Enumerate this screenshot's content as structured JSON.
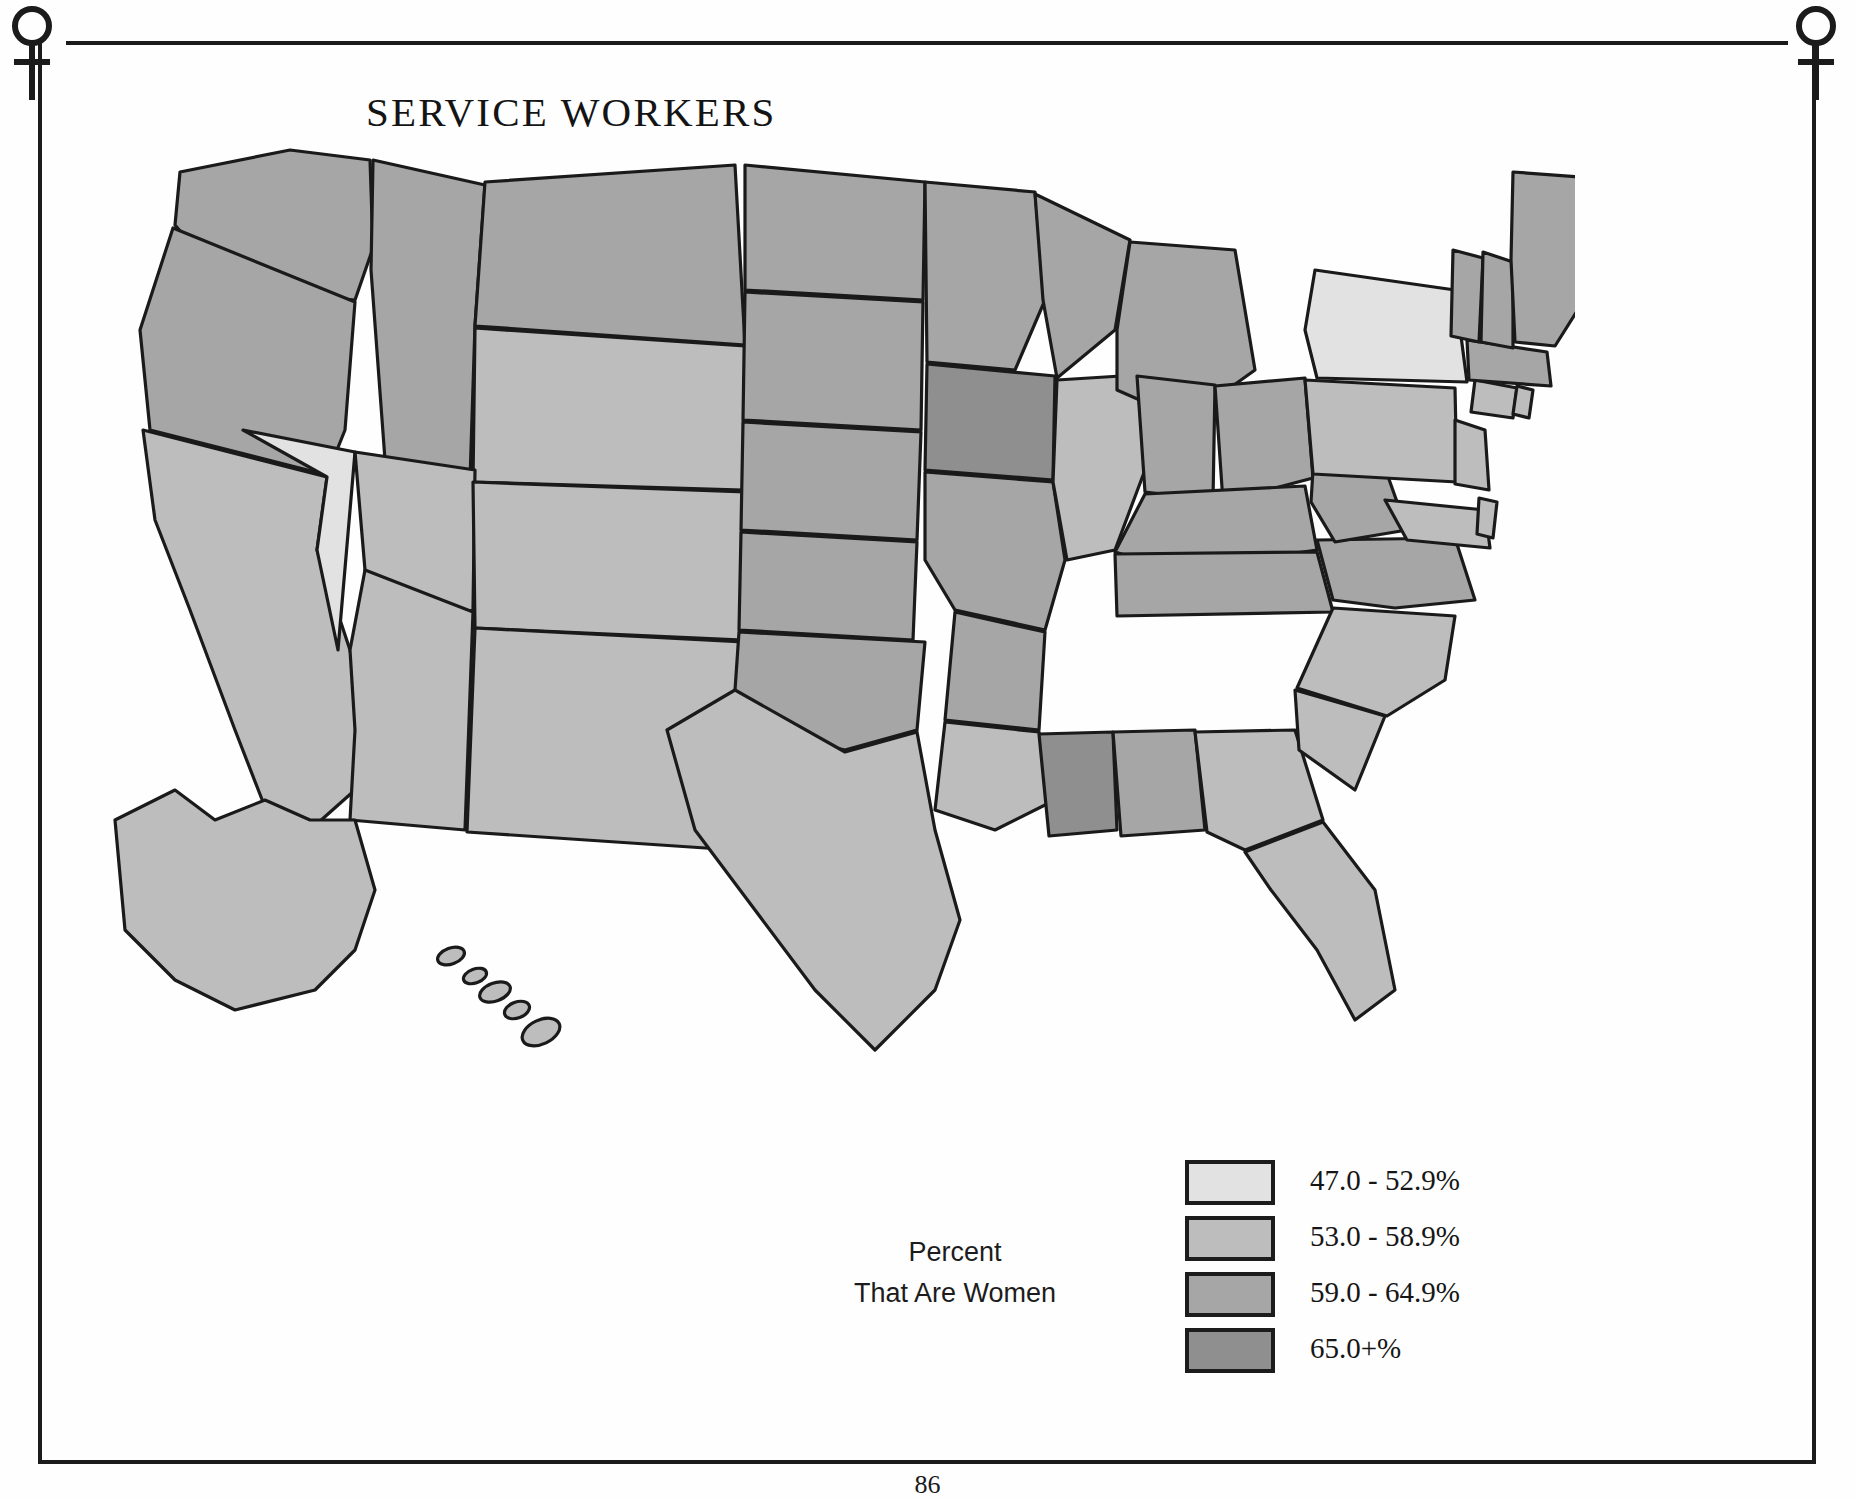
{
  "page": {
    "title": "SERVICE WORKERS",
    "page_number": "86",
    "corner_icon": "venus-female-symbol"
  },
  "legend": {
    "caption_line1": "Percent",
    "caption_line2": "That Are Women",
    "items": [
      {
        "label": "47.0 - 52.9%",
        "color": "#e2e2e2"
      },
      {
        "label": "53.0 - 58.9%",
        "color": "#bdbdbd"
      },
      {
        "label": "59.0 - 64.9%",
        "color": "#a6a6a6"
      },
      {
        "label": "65.0+%",
        "color": "#8f8f8f"
      }
    ]
  },
  "chart_data": {
    "type": "map",
    "title": "SERVICE WORKERS",
    "subtitle": "Percent That Are Women",
    "legend_position": "bottom-right",
    "bins": [
      {
        "label": "47.0 - 52.9%",
        "min": 47.0,
        "max": 52.9,
        "color": "#e2e2e2"
      },
      {
        "label": "53.0 - 58.9%",
        "min": 53.0,
        "max": 58.9,
        "color": "#bdbdbd"
      },
      {
        "label": "59.0 - 64.9%",
        "min": 59.0,
        "max": 64.9,
        "color": "#a6a6a6"
      },
      {
        "label": "65.0+%",
        "min": 65.0,
        "max": null,
        "color": "#8f8f8f"
      }
    ],
    "values": {
      "AL": 2,
      "AK": 1,
      "AZ": 1,
      "AR": 2,
      "CA": 1,
      "CO": 1,
      "CT": 1,
      "DE": 1,
      "FL": 1,
      "GA": 1,
      "HI": 1,
      "ID": 2,
      "IL": 1,
      "IN": 2,
      "IA": 3,
      "KS": 2,
      "KY": 2,
      "LA": 1,
      "ME": 2,
      "MD": 1,
      "MA": 2,
      "MI": 2,
      "MN": 2,
      "MS": 3,
      "MO": 2,
      "MT": 2,
      "NE": 2,
      "NV": 0,
      "NH": 2,
      "NJ": 1,
      "NM": 1,
      "NY": 0,
      "NC": 1,
      "ND": 2,
      "OH": 2,
      "OK": 2,
      "OR": 2,
      "PA": 1,
      "RI": 1,
      "SC": 1,
      "SD": 2,
      "TN": 2,
      "TX": 1,
      "UT": 1,
      "VT": 2,
      "VA": 2,
      "WA": 2,
      "WV": 2,
      "WI": 2,
      "WY": 1
    },
    "state_names": {
      "AL": "Alabama",
      "AK": "Alaska",
      "AZ": "Arizona",
      "AR": "Arkansas",
      "CA": "California",
      "CO": "Colorado",
      "CT": "Connecticut",
      "DE": "Delaware",
      "FL": "Florida",
      "GA": "Georgia",
      "HI": "Hawaii",
      "ID": "Idaho",
      "IL": "Illinois",
      "IN": "Indiana",
      "IA": "Iowa",
      "KS": "Kansas",
      "KY": "Kentucky",
      "LA": "Louisiana",
      "ME": "Maine",
      "MD": "Maryland",
      "MA": "Massachusetts",
      "MI": "Michigan",
      "MN": "Minnesota",
      "MS": "Mississippi",
      "MO": "Missouri",
      "MT": "Montana",
      "NE": "Nebraska",
      "NV": "Nevada",
      "NH": "New Hampshire",
      "NJ": "New Jersey",
      "NM": "New Mexico",
      "NY": "New York",
      "NC": "North Carolina",
      "ND": "North Dakota",
      "OH": "Ohio",
      "OK": "Oklahoma",
      "OR": "Oregon",
      "PA": "Pennsylvania",
      "RI": "Rhode Island",
      "SC": "South Carolina",
      "SD": "South Dakota",
      "TN": "Tennessee",
      "TX": "Texas",
      "UT": "Utah",
      "VT": "Vermont",
      "VA": "Virginia",
      "WA": "Washington",
      "WV": "West Virginia",
      "WI": "Wisconsin",
      "WY": "Wyoming"
    }
  }
}
